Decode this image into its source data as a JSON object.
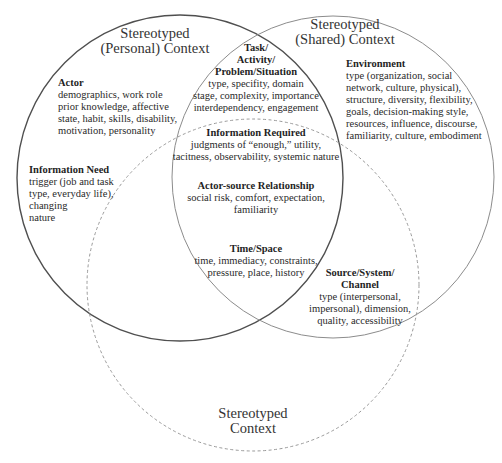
{
  "diagram": {
    "type": "venn",
    "circles": [
      {
        "id": "personal",
        "title_lines": [
          "Stereotyped",
          "(Personal) Context"
        ],
        "stroke": "#555555",
        "style": "solid"
      },
      {
        "id": "shared",
        "title_lines": [
          "Stereotyped",
          "(Shared) Context"
        ],
        "stroke": "#8a8a8a",
        "style": "solid"
      },
      {
        "id": "stereotyped",
        "title_lines": [
          "Stereotyped",
          "Context"
        ],
        "stroke": "#9a9a9a",
        "style": "dashed"
      }
    ],
    "regions": {
      "actor": {
        "heading": "Actor",
        "lines": [
          "demographics, work role",
          "prior knowledge, affective",
          "state, habit, skills, disability,",
          "motivation, personality"
        ]
      },
      "information_need": {
        "heading": "Information Need",
        "lines": [
          "trigger (job and task",
          "type, everyday life),",
          "changing",
          "nature"
        ]
      },
      "task": {
        "heading_lines": [
          "Task/",
          "Activity/",
          "Problem/Situation"
        ],
        "lines": [
          "type, specifity, domain",
          "stage, complexity, importance",
          "interdependency, engagement"
        ]
      },
      "information_required": {
        "heading": "Information Required",
        "lines": [
          "judgments of “enough,” utility,",
          "tacitness, observability, systemic nature"
        ]
      },
      "actor_source": {
        "heading": "Actor-source Relationship",
        "lines": [
          "social risk, comfort, expectation,",
          "familiarity"
        ]
      },
      "time_space": {
        "heading": "Time/Space",
        "lines": [
          "time, immediacy, constraints,",
          "pressure, place, history"
        ]
      },
      "environment": {
        "heading": "Environment",
        "lines": [
          "type (organization, social",
          "network, culture, physical),",
          "structure, diversity, flexibility,",
          "goals, decision-making style,",
          "resources, influence, discourse,",
          "familiarity, culture, embodiment"
        ]
      },
      "source_system": {
        "heading_lines": [
          "Source/System/",
          "Channel"
        ],
        "lines": [
          "type (interpersonal,",
          "impersonal), dimension,",
          "quality, accessibility"
        ]
      }
    }
  }
}
